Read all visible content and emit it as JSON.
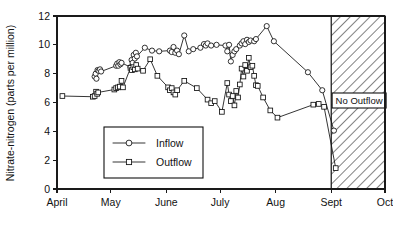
{
  "chart_data": {
    "type": "line",
    "title": "",
    "xlabel": "",
    "ylabel": "Nitrate-nitrogen (parts per million)",
    "ylim": [
      0,
      12
    ],
    "yticks": [
      0,
      2,
      4,
      6,
      8,
      10,
      12
    ],
    "ytick_labels": [
      "0",
      "2",
      "4",
      "6",
      "8",
      "10",
      "12"
    ],
    "xlim": [
      0,
      183
    ],
    "xticks": [
      0,
      30,
      61,
      91,
      122,
      153,
      183
    ],
    "xtick_labels": [
      "April",
      "May",
      "June",
      "July",
      "Aug",
      "Sept",
      "Oct"
    ],
    "grid": false,
    "legend_position": "lower-left-inside",
    "marker_legend": [
      "circle",
      "square"
    ],
    "annotations": [
      {
        "name": "no-outflow-region",
        "label": "No Outflow",
        "x_start": 153,
        "x_end": 183,
        "fill": "hatched-diagonal"
      }
    ],
    "series": [
      {
        "name": "Inflow",
        "marker": "circle",
        "color": "#111111",
        "points": [
          [
            21.0,
            7.8
          ],
          [
            21.6,
            8.0
          ],
          [
            22.0,
            7.65
          ],
          [
            22.6,
            8.25
          ],
          [
            23.2,
            8.2
          ],
          [
            24.0,
            8.3
          ],
          [
            24.6,
            8.15
          ],
          [
            33.0,
            8.55
          ],
          [
            33.6,
            8.7
          ],
          [
            34.2,
            8.55
          ],
          [
            34.8,
            8.8
          ],
          [
            35.4,
            8.65
          ],
          [
            36.0,
            8.75
          ],
          [
            41.0,
            8.45
          ],
          [
            41.6,
            8.95
          ],
          [
            42.2,
            8.75
          ],
          [
            42.8,
            9.3
          ],
          [
            43.4,
            9.05
          ],
          [
            44.0,
            9.45
          ],
          [
            44.6,
            9.2
          ],
          [
            49.0,
            9.8
          ],
          [
            53.0,
            9.6
          ],
          [
            57.0,
            9.55
          ],
          [
            63.0,
            9.6
          ],
          [
            64.0,
            9.5
          ],
          [
            65.0,
            9.85
          ],
          [
            66.0,
            9.45
          ],
          [
            67.0,
            9.6
          ],
          [
            68.0,
            9.35
          ],
          [
            71.0,
            10.65
          ],
          [
            73.5,
            9.55
          ],
          [
            76.0,
            9.7
          ],
          [
            80.0,
            9.8
          ],
          [
            82.0,
            10.05
          ],
          [
            83.0,
            9.95
          ],
          [
            84.0,
            10.1
          ],
          [
            86.0,
            9.95
          ],
          [
            89.0,
            10.0
          ],
          [
            94.0,
            9.95
          ],
          [
            95.0,
            9.55
          ],
          [
            96.0,
            10.0
          ],
          [
            97.0,
            8.85
          ],
          [
            98.0,
            9.3
          ],
          [
            99.0,
            9.55
          ],
          [
            100.0,
            9.7
          ],
          [
            102.0,
            9.95
          ],
          [
            103.0,
            10.1
          ],
          [
            104.0,
            10.25
          ],
          [
            105.0,
            10.05
          ],
          [
            106.0,
            10.35
          ],
          [
            107.0,
            10.2
          ],
          [
            108.0,
            10.3
          ],
          [
            110.0,
            10.25
          ],
          [
            111.0,
            10.4
          ],
          [
            117.0,
            11.3
          ],
          [
            121.0,
            10.25
          ],
          [
            140.0,
            8.1
          ],
          [
            148.0,
            6.85
          ],
          [
            154.5,
            4.05
          ]
        ]
      },
      {
        "name": "Outflow",
        "marker": "square",
        "color": "#111111",
        "points": [
          [
            3.0,
            6.45
          ],
          [
            20.0,
            6.4
          ],
          [
            21.0,
            6.45
          ],
          [
            21.8,
            6.75
          ],
          [
            22.4,
            6.6
          ],
          [
            23.0,
            6.7
          ],
          [
            32.0,
            6.9
          ],
          [
            33.0,
            7.0
          ],
          [
            34.0,
            7.05
          ],
          [
            35.0,
            7.1
          ],
          [
            36.0,
            7.5
          ],
          [
            36.8,
            7.05
          ],
          [
            41.0,
            8.4
          ],
          [
            41.8,
            8.25
          ],
          [
            42.6,
            8.45
          ],
          [
            43.4,
            8.3
          ],
          [
            44.2,
            8.6
          ],
          [
            45.0,
            8.35
          ],
          [
            48.0,
            8.2
          ],
          [
            52.0,
            9.0
          ],
          [
            56.0,
            7.85
          ],
          [
            62.0,
            7.05
          ],
          [
            63.0,
            6.85
          ],
          [
            64.0,
            7.0
          ],
          [
            65.0,
            6.7
          ],
          [
            66.0,
            6.55
          ],
          [
            67.0,
            6.85
          ],
          [
            71.0,
            7.5
          ],
          [
            78.0,
            7.0
          ],
          [
            84.0,
            6.2
          ],
          [
            86.0,
            5.95
          ],
          [
            88.0,
            6.1
          ],
          [
            92.0,
            5.35
          ],
          [
            95.0,
            7.35
          ],
          [
            96.0,
            6.55
          ],
          [
            97.0,
            6.1
          ],
          [
            98.0,
            6.45
          ],
          [
            99.0,
            5.8
          ],
          [
            100.0,
            6.8
          ],
          [
            101.0,
            6.35
          ],
          [
            102.0,
            7.25
          ],
          [
            103.0,
            8.35
          ],
          [
            104.0,
            7.8
          ],
          [
            105.0,
            8.6
          ],
          [
            106.0,
            8.2
          ],
          [
            107.0,
            9.1
          ],
          [
            108.0,
            8.45
          ],
          [
            109.0,
            8.55
          ],
          [
            110.0,
            7.85
          ],
          [
            111.0,
            7.2
          ],
          [
            112.0,
            7.15
          ],
          [
            115.0,
            6.35
          ],
          [
            119.0,
            5.45
          ],
          [
            123.0,
            4.95
          ],
          [
            143.0,
            5.85
          ],
          [
            146.0,
            5.9
          ],
          [
            149.0,
            5.7
          ],
          [
            155.5,
            1.45
          ]
        ]
      }
    ],
    "legend": [
      {
        "label": "Inflow",
        "marker": "circle"
      },
      {
        "label": "Outflow",
        "marker": "square"
      }
    ]
  }
}
